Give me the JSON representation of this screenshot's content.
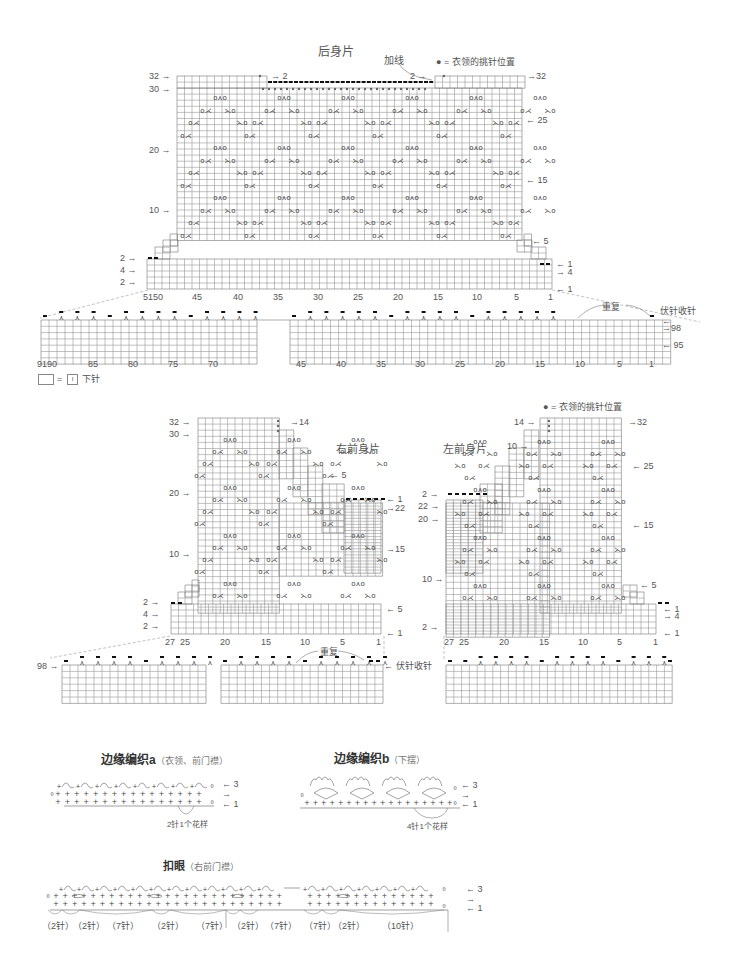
{
  "back_body": {
    "title": "后身片",
    "add_yarn_label": "加线",
    "neck_legend": "● = 衣领的挑针位置",
    "left_row_labels": [
      "32 →",
      "30 →",
      "20 →",
      "10 →",
      "2 →",
      "4 →",
      "2 →"
    ],
    "right_row_labels": [
      "→32",
      "← 25",
      "← 15",
      "← 5",
      "← 1",
      "→ 4",
      "← 1"
    ],
    "inner_labels": [
      "→ 2",
      "2 →"
    ],
    "stitch_numbers": [
      "5150",
      "45",
      "40",
      "35",
      "30",
      "25",
      "20",
      "15",
      "10",
      "5",
      "1"
    ]
  },
  "back_hem": {
    "repeat_label": "重复",
    "bind_off_label": "伏针收针",
    "right_row_labels": [
      "←",
      "→98",
      "← 95"
    ],
    "left_numbers": [
      "9190",
      "85",
      "80",
      "75",
      "70"
    ],
    "right_numbers": [
      "45",
      "40",
      "35",
      "30",
      "25",
      "20",
      "15",
      "10",
      "5",
      "1"
    ]
  },
  "legend": {
    "equals": "=",
    "symbol": "I",
    "meaning": "下针"
  },
  "right_front": {
    "title": "右前身片",
    "left_row_labels": [
      "32 →",
      "30 →",
      "20 →",
      "10 →",
      "2 →",
      "4 →",
      "2 →"
    ],
    "right_row_labels": [
      "→14",
      "← 5",
      "← 1",
      "→22",
      "→15",
      "← 5",
      "← 1"
    ],
    "stitch_numbers": [
      "27",
      "25",
      "20",
      "15",
      "10",
      "5",
      "1"
    ]
  },
  "right_front_hem": {
    "row_label": "98 →",
    "repeat_label": "重复",
    "bind_off_label": "← 伏针收针"
  },
  "left_front": {
    "title": "左前身片",
    "neck_legend": "● = 衣领的挑针位置",
    "left_row_labels": [
      "14 →",
      "10 →",
      "2 →",
      "22 →",
      "20 →",
      "10 →",
      "2 →"
    ],
    "right_row_labels": [
      "→32",
      "← 25",
      "← 15",
      "← 5",
      "← 1",
      "→ 4",
      "← 1"
    ],
    "stitch_numbers": [
      "27",
      "25",
      "20",
      "15",
      "10",
      "5",
      "1"
    ]
  },
  "edging_a": {
    "title": "边缘编织a",
    "subtitle": "（衣领、前门襟）",
    "row_labels": [
      "← 3",
      "→",
      "← 1"
    ],
    "repeat_note": "2针1个花样"
  },
  "edging_b": {
    "title": "边缘编织b",
    "subtitle": "（下摆）",
    "row_labels": [
      "← 3",
      "→",
      "← 1"
    ],
    "repeat_note": "4针1个花样"
  },
  "buttonhole": {
    "title": "扣眼",
    "subtitle": "（右前门襟）",
    "row_labels": [
      "← 3",
      "→",
      "← 1"
    ],
    "spacing_labels": [
      "（2针）",
      "（2针）",
      "（7针）",
      "（2针）",
      "（7针）",
      "（2针）",
      "（7针）",
      "（7针）",
      "（2针）",
      "（10针）"
    ]
  },
  "chart_symbols": {
    "yo": "o",
    "k2tog": "⋌",
    "ssk": "⋋",
    "pickup_dot": "●",
    "bind_off": "▬",
    "lace_motif": "o⋏o"
  }
}
